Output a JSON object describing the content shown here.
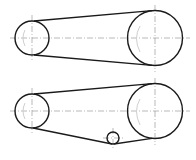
{
  "diagram": {
    "colors": {
      "outline": "#1a1a1a",
      "centerline": "#8a8a8a",
      "background": "#ffffff"
    },
    "views": [
      {
        "name": "open-belt-drive",
        "pulleys": [
          {
            "role": "driver-small",
            "cx": 32,
            "cy": 38,
            "r": 17
          },
          {
            "role": "driven-large",
            "cx": 155,
            "cy": 38,
            "r": 27.5
          }
        ]
      },
      {
        "name": "belt-drive-with-idler",
        "pulleys": [
          {
            "role": "driver-small",
            "cx": 32,
            "cy": 111,
            "r": 17
          },
          {
            "role": "driven-large",
            "cx": 155,
            "cy": 111,
            "r": 27.5
          },
          {
            "role": "idler",
            "cx": 113,
            "cy": 138,
            "r": 6
          }
        ]
      }
    ]
  }
}
